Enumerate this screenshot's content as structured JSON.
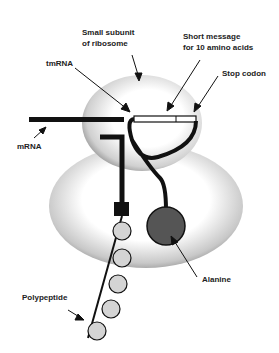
{
  "diagram": {
    "labels": {
      "small_subunit_line1": "Small subunit",
      "small_subunit_line2": "of ribosome",
      "short_message_line1": "Short message",
      "short_message_line2": "for 10 amino acids",
      "tmrna": "tmRNA",
      "stop_codon": "Stop codon",
      "mrna": "mRNA",
      "alanine": "Alanine",
      "polypeptide": "Polypeptide"
    },
    "components": {
      "small_subunit": {
        "shape": "ellipse",
        "color": "#e6e6e6"
      },
      "large_subunit": {
        "shape": "ellipse",
        "color": "#d9d9d9"
      },
      "alanine": {
        "shape": "circle",
        "color": "#555555"
      },
      "amino_acid_bead": {
        "shape": "circle",
        "color": "#d4d4d4",
        "count": 5
      },
      "attachment_block": {
        "shape": "square",
        "color": "#111111"
      }
    }
  }
}
